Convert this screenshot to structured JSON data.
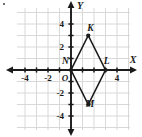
{
  "figure": {
    "title": "",
    "axes": {
      "x_label": "X",
      "y_label": "Y",
      "origin_label": "O",
      "x_ticks": [
        -4,
        -2,
        4
      ],
      "x_tick_labels": [
        "-4",
        "-2",
        "4"
      ],
      "y_ticks": [
        4,
        2,
        -2,
        -4
      ],
      "y_tick_labels": [
        "4",
        "2",
        "-2",
        "-4"
      ],
      "xlim": [
        -5,
        5
      ],
      "ylim": [
        -5,
        5
      ],
      "grid": true,
      "grid_color": "#d8d8d8",
      "axis_color": "#1a1a1a"
    },
    "shape": {
      "name": "rhombus-klmn",
      "type": "polygon",
      "stroke_color": "#1a1a1a",
      "fill": "none",
      "vertices": [
        {
          "label": "K",
          "x": 1.5,
          "y": 3,
          "label_dx": 0.45,
          "label_dy": 0.75
        },
        {
          "label": "L",
          "x": 3,
          "y": 0,
          "label_dx": 0.25,
          "label_dy": 0.95
        },
        {
          "label": "M",
          "x": 1.5,
          "y": -3,
          "label_dx": 0.35,
          "label_dy": -0.35
        },
        {
          "label": "N",
          "x": 0,
          "y": 0,
          "label_dx": -1.15,
          "label_dy": 0.95
        }
      ]
    }
  }
}
